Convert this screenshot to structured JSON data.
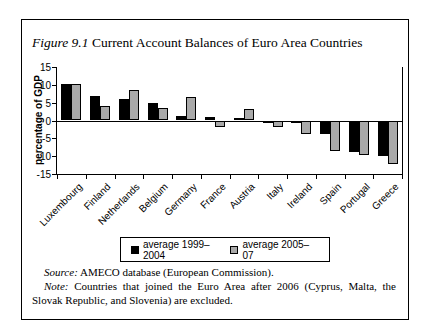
{
  "title": {
    "prefix": "Figure 9.1",
    "text": " Current Account Balances of Euro Area Countries"
  },
  "chart_data": {
    "type": "bar",
    "title": "Figure 9.1 Current Account Balances of Euro Area Countries",
    "xlabel": "",
    "ylabel": "percentage of GDP",
    "ylim": [
      -15,
      15
    ],
    "yticks": [
      15,
      10,
      5,
      0,
      -5,
      -10,
      -15
    ],
    "grid": false,
    "legend_position": "bottom",
    "categories": [
      "Luxembourg",
      "Finland",
      "Netherlands",
      "Belgium",
      "Germany",
      "France",
      "Austria",
      "Italy",
      "Ireland",
      "Spain",
      "Portugal",
      "Greece"
    ],
    "series": [
      {
        "name": "average 1999–2004",
        "color": "#000000",
        "values": [
          10.3,
          7.0,
          5.9,
          5.0,
          1.2,
          0.9,
          0.8,
          -0.2,
          -0.4,
          -3.9,
          -8.7,
          -10.0
        ]
      },
      {
        "name": "average 2005–07",
        "color": "#a9a9a9",
        "values": [
          10.2,
          4.0,
          8.5,
          3.6,
          6.5,
          -1.9,
          3.3,
          -1.7,
          -3.9,
          -8.5,
          -9.7,
          -12.3
        ]
      }
    ]
  },
  "footer": {
    "source_label": "Source:",
    "source_text": "AMECO database (European Commission).",
    "note_label": "Note:",
    "note_text": "Countries that joined the Euro Area after 2006 (Cyprus, Malta, the Slovak Republic, and Slovenia) are excluded."
  }
}
